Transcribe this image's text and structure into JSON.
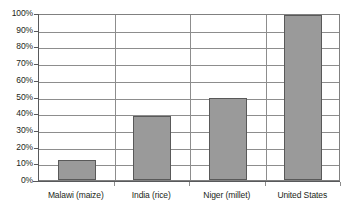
{
  "chart_data": {
    "type": "bar",
    "title": "",
    "subtitle": "",
    "xlabel": "",
    "ylabel": "",
    "categories": [
      "Malawi (maize)",
      "India (rice)",
      "Niger (millet)",
      "United States"
    ],
    "values": [
      12,
      39,
      50,
      100
    ],
    "value_unit": "%",
    "ylim": [
      0,
      100
    ],
    "ytick_labels": [
      "100%",
      "90%",
      "80%",
      "70%",
      "60%",
      "50%",
      "40%",
      "30%",
      "20%",
      "10%",
      "0%"
    ],
    "ytick_values": [
      100,
      90,
      80,
      70,
      60,
      50,
      40,
      30,
      20,
      10,
      0
    ],
    "grid": true,
    "grid_axis": "y",
    "legend": false,
    "legend_position": "none",
    "orientation": "vertical",
    "series": [
      {
        "name": "",
        "values": [
          12,
          39,
          50,
          100
        ]
      }
    ],
    "colors": {
      "bar_fill": "#9a9a9a",
      "bar_stroke": "#595959",
      "gridline": "#8d8d8d",
      "axis": "#58595b",
      "plot_border": "#808080",
      "background": "#ffffff",
      "text": "#231f20"
    }
  }
}
